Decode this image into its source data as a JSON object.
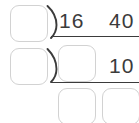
{
  "worksheet": {
    "type": "long-division",
    "colors": {
      "background": "#ffffff",
      "box_border": "#d2d2d2",
      "ink": "#3b3b3b"
    },
    "rows": [
      {
        "id": "row-1",
        "divisor_box_value": "",
        "divisor_box_placeholder": "",
        "bracket_icon": "division-bracket-icon",
        "dividend_digits": [
          "16",
          "40"
        ],
        "has_bar": true
      },
      {
        "id": "row-2",
        "divisor_box_value": "",
        "divisor_box_placeholder": "",
        "bracket_icon": "division-bracket-icon",
        "dividend_box_value": "",
        "dividend_box_placeholder": "",
        "dividend_digits": [
          "10"
        ],
        "has_bar": true
      },
      {
        "id": "row-3",
        "boxes": [
          {
            "value": "",
            "placeholder": ""
          },
          {
            "value": "",
            "placeholder": ""
          }
        ]
      }
    ]
  }
}
